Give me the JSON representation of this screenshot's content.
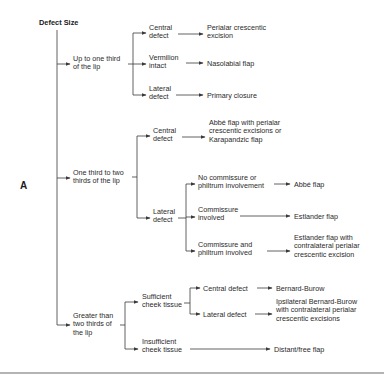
{
  "figure_label": "A",
  "root": "Defect Size",
  "colors": {
    "text": "#2a2a2a",
    "lines": "#3a3a3a",
    "background": "#ffffff"
  },
  "groups": [
    {
      "label": [
        "Up to one third",
        "of the lip"
      ],
      "branches": [
        {
          "label": [
            "Central",
            "defect"
          ],
          "result": [
            "Perialar crescentic",
            "excision"
          ]
        },
        {
          "label": [
            "Vermilion",
            "intact"
          ],
          "result": [
            "Nasolabial flap"
          ]
        },
        {
          "label": [
            "Lateral",
            "defect"
          ],
          "result": [
            "Primary closure"
          ]
        }
      ]
    },
    {
      "label": [
        "One third to two",
        "thirds of the lip"
      ],
      "branches": [
        {
          "label": [
            "Central",
            "defect"
          ],
          "result": [
            "Abbé flap with perialar",
            "crescentic excisions or",
            "Karapandzic flap"
          ]
        },
        {
          "label": [
            "Lateral",
            "defect"
          ],
          "sub": [
            {
              "label": [
                "No commissure or",
                "philtrum involvement"
              ],
              "result": [
                "Abbé flap"
              ]
            },
            {
              "label": [
                "Commissure",
                "involved"
              ],
              "result": [
                "Estlander flap"
              ]
            },
            {
              "label": [
                "Commissure and",
                "philtrum involved"
              ],
              "result": [
                "Estlander flap with",
                "contralateral perialar",
                "crescentic excision"
              ]
            }
          ]
        }
      ]
    },
    {
      "label": [
        "Greater than",
        "two thirds of",
        "the lip"
      ],
      "branches": [
        {
          "label": [
            "Sufficient",
            "cheek tissue"
          ],
          "sub": [
            {
              "label": [
                "Central defect"
              ],
              "result": [
                "Bernard-Burow"
              ]
            },
            {
              "label": [
                "Lateral defect"
              ],
              "result": [
                "Ipsilateral Bernard-Burow",
                "with contralateral perialar",
                "crescentic excisions"
              ]
            }
          ]
        },
        {
          "label": [
            "Insufficient",
            "cheek tissue"
          ],
          "result": [
            "Distant/free flap"
          ]
        }
      ]
    }
  ]
}
